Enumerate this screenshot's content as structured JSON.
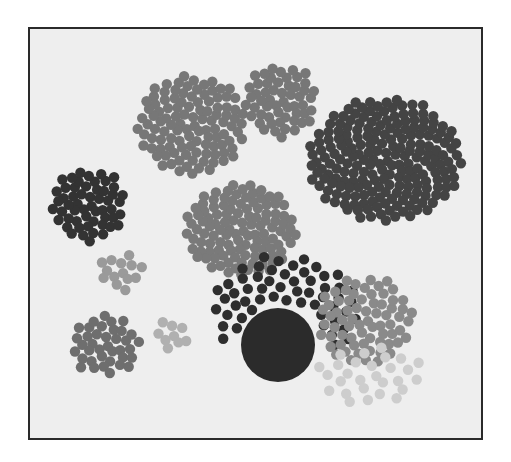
{
  "diagram": {
    "type": "packed-circle-clusters",
    "frame": {
      "x": 28,
      "y": 27,
      "width": 455,
      "height": 413,
      "border_color": "#2a2a2a",
      "background": "#eeeeee"
    },
    "dot_radius": 5.2,
    "clusters": [
      {
        "id": "top-left-medium",
        "cx": 192,
        "cy": 125,
        "rx": 55,
        "ry": 50,
        "count": 110,
        "color": "#777777"
      },
      {
        "id": "top-center-small",
        "cx": 281,
        "cy": 101,
        "rx": 37,
        "ry": 36,
        "count": 55,
        "color": "#777777"
      },
      {
        "id": "right-large",
        "cx": 385,
        "cy": 160,
        "rx": 77,
        "ry": 62,
        "count": 210,
        "color": "#444444"
      },
      {
        "id": "left-dark",
        "cx": 89,
        "cy": 205,
        "rx": 38,
        "ry": 36,
        "count": 55,
        "color": "#333333"
      },
      {
        "id": "center-medium",
        "cx": 241,
        "cy": 230,
        "rx": 56,
        "ry": 47,
        "count": 115,
        "color": "#7a7a7a"
      },
      {
        "id": "left-small-light",
        "cx": 120,
        "cy": 272,
        "rx": 22,
        "ry": 20,
        "count": 14,
        "color": "#9a9a9a"
      },
      {
        "id": "bottom-left-medium",
        "cx": 105,
        "cy": 345,
        "rx": 35,
        "ry": 30,
        "count": 38,
        "color": "#6e6e6e"
      },
      {
        "id": "bottom-tiny-light",
        "cx": 171,
        "cy": 335,
        "rx": 17,
        "ry": 17,
        "count": 9,
        "color": "#b0b0b0"
      },
      {
        "id": "arc-dark",
        "cx": 285,
        "cy": 310,
        "rx": 75,
        "ry": 55,
        "count": 85,
        "color": "#2e2e2e",
        "arc": true
      },
      {
        "id": "right-gray-lower",
        "cx": 365,
        "cy": 320,
        "rx": 48,
        "ry": 45,
        "count": 70,
        "color": "#8a8a8a"
      },
      {
        "id": "faint-bottom-right",
        "cx": 370,
        "cy": 375,
        "rx": 55,
        "ry": 30,
        "count": 28,
        "color": "#cdcdcd"
      }
    ],
    "big_circle": {
      "cx": 278,
      "cy": 345,
      "r": 37,
      "color": "#2b2b2b"
    }
  }
}
